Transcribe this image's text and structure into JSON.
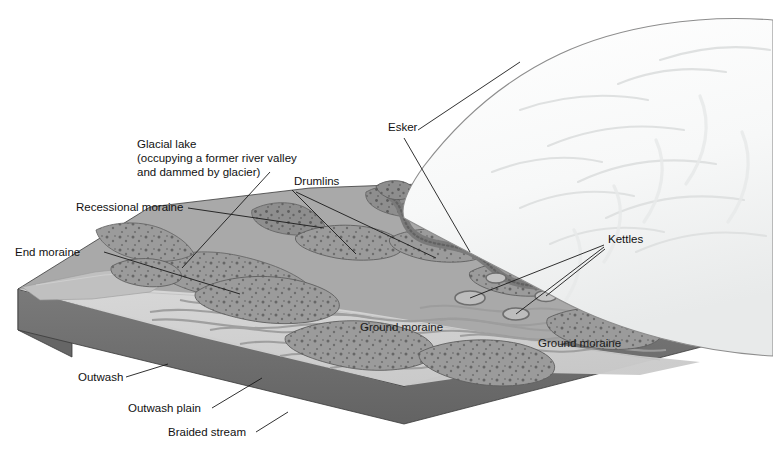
{
  "figure": {
    "kind": "block-diagram",
    "background_color": "#ffffff"
  },
  "palette": {
    "ice_white": "#fbfbfb",
    "ice_shadow": "#eceded",
    "ice_line": "#8d8d8d",
    "ground_moraine": "#a9a9a9",
    "ground_moraine_dark": "#9a9a9a",
    "drumlin_fill": "#9b9b9b",
    "drumlin_edge": "#6f6f6f",
    "moraine_ridge": "#8e8e8e",
    "outwash_plain": "#d2d2d2",
    "outwash_light": "#dcdcdc",
    "lake_fill": "#bdbdbd",
    "braided_channel": "#9d9d9d",
    "kettle_fill": "#7d7d7d",
    "block_side": "#6f6f6f",
    "block_side_dark": "#636363",
    "boulder": "#5e5e5e",
    "outline": "#3a3a3a",
    "label_text": "#111111"
  },
  "labels": [
    {
      "id": "glacial-lake",
      "lines": [
        "Glacial lake",
        "(occupying a former river valley",
        "and dammed by glacier)"
      ],
      "x": 137,
      "y": 148,
      "anchor": "start"
    },
    {
      "id": "recessional-moraine",
      "lines": [
        "Recessional moraine"
      ],
      "x": 76,
      "y": 211,
      "anchor": "start"
    },
    {
      "id": "end-moraine",
      "lines": [
        "End moraine"
      ],
      "x": 15,
      "y": 256,
      "anchor": "start"
    },
    {
      "id": "drumlins",
      "lines": [
        "Drumlins"
      ],
      "x": 294,
      "y": 185,
      "anchor": "start"
    },
    {
      "id": "esker",
      "lines": [
        "Esker"
      ],
      "x": 388,
      "y": 131,
      "anchor": "start"
    },
    {
      "id": "kettles",
      "lines": [
        "Kettles"
      ],
      "x": 608,
      "y": 243,
      "anchor": "start"
    },
    {
      "id": "ground-moraine-left",
      "lines": [
        "Ground moraine"
      ],
      "x": 360,
      "y": 331,
      "anchor": "start"
    },
    {
      "id": "ground-moraine-right",
      "lines": [
        "Ground moraine"
      ],
      "x": 538,
      "y": 347,
      "anchor": "start"
    },
    {
      "id": "outwash",
      "lines": [
        "Outwash"
      ],
      "x": 78,
      "y": 381,
      "anchor": "start"
    },
    {
      "id": "outwash-plain",
      "lines": [
        "Outwash plain"
      ],
      "x": 128,
      "y": 412,
      "anchor": "start"
    },
    {
      "id": "braided-stream",
      "lines": [
        "Braided stream"
      ],
      "x": 168,
      "y": 436,
      "anchor": "start"
    }
  ]
}
